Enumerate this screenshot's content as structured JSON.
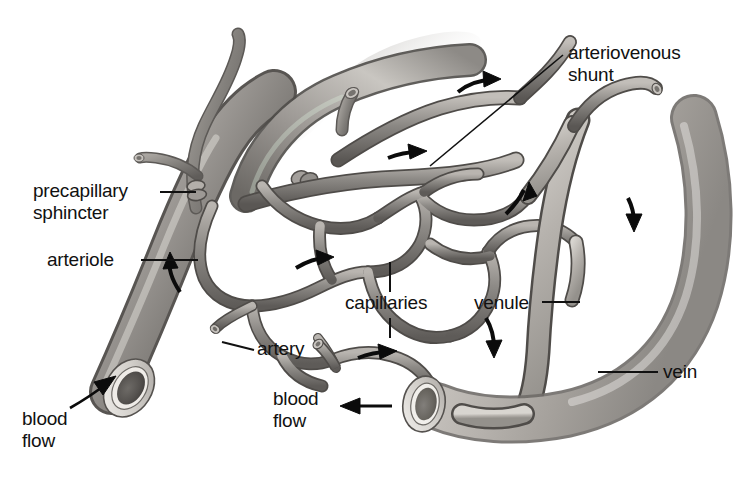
{
  "figure": {
    "background_color": "#ffffff",
    "ink_color": "#111111"
  },
  "labels": {
    "arteriovenous_shunt": "arteriovenous\nshunt",
    "precapillary_sphincter": "precapillary\nsphincter",
    "arteriole": "arteriole",
    "capillaries": "capillaries",
    "venule": "venule",
    "artery": "artery",
    "vein": "vein",
    "blood_flow_left": "blood\nflow",
    "blood_flow_bottom": "blood\nflow"
  },
  "vessel_colors": {
    "artery_dark": "#6f6c69",
    "artery_mid": "#9a9793",
    "artery_light": "#d7d4cf",
    "vein_light": "#cfcbc5",
    "vein_mid": "#a9a5a0",
    "capillary_mid": "#8d8a86",
    "lumen_dark": "#575451",
    "outline": "#4a4744"
  },
  "flow_arrows": [
    {
      "name": "arrow-arteriole-up",
      "x": 172,
      "y": 272,
      "direction": "up-left"
    },
    {
      "name": "arrow-capillary-mid-right",
      "x": 315,
      "y": 262,
      "direction": "right"
    },
    {
      "name": "arrow-capillary-lower-right",
      "x": 378,
      "y": 352,
      "direction": "right"
    },
    {
      "name": "arrow-shunt-upper",
      "x": 480,
      "y": 86,
      "direction": "right"
    },
    {
      "name": "arrow-shunt-mid",
      "x": 405,
      "y": 155,
      "direction": "right"
    },
    {
      "name": "arrow-venule-up",
      "x": 520,
      "y": 196,
      "direction": "up-right"
    },
    {
      "name": "arrow-venule-down",
      "x": 494,
      "y": 340,
      "direction": "down"
    },
    {
      "name": "arrow-vein-down",
      "x": 632,
      "y": 208,
      "direction": "down"
    },
    {
      "name": "arrow-bloodflow-artery",
      "x": 88,
      "y": 398,
      "direction": "up-right"
    },
    {
      "name": "arrow-bloodflow-vein",
      "x": 370,
      "y": 406,
      "direction": "left"
    }
  ]
}
